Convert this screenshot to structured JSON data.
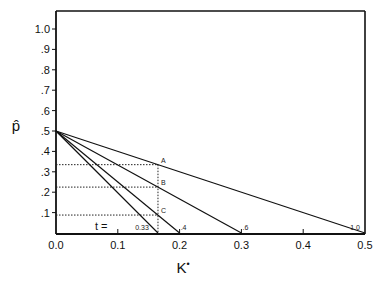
{
  "chart_data": {
    "type": "line",
    "title": "",
    "xlabel": "K*",
    "ylabel": "p̂",
    "xlim": [
      0.0,
      0.5
    ],
    "ylim": [
      0.0,
      1.08
    ],
    "x_ticks": [
      "0.0",
      "0.1",
      "0.2",
      "0.3",
      "0.4",
      "0.5"
    ],
    "y_ticks": [
      ".1",
      ".2",
      ".3",
      ".4",
      ".5",
      ".6",
      ".7",
      ".8",
      ".9",
      "1.0"
    ],
    "grid": false,
    "legend": null,
    "t_prefix": "t =",
    "series": [
      {
        "name": "0.33",
        "x": [
          0.0,
          0.165
        ],
        "y": [
          0.5,
          0.0
        ]
      },
      {
        "name": ".4",
        "x": [
          0.0,
          0.2
        ],
        "y": [
          0.5,
          0.0
        ]
      },
      {
        "name": ".6",
        "x": [
          0.0,
          0.3
        ],
        "y": [
          0.5,
          0.0
        ]
      },
      {
        "name": "1.0",
        "x": [
          0.0,
          0.5
        ],
        "y": [
          0.5,
          0.0
        ]
      }
    ],
    "annotations": [
      {
        "label": "A",
        "x": 0.165,
        "y": 0.335
      },
      {
        "label": "B",
        "x": 0.165,
        "y": 0.225
      },
      {
        "label": "C",
        "x": 0.165,
        "y": 0.088
      }
    ],
    "reference_lines": {
      "vertical_dotted_x": 0.165,
      "horizontal_dotted_y": [
        0.335,
        0.225,
        0.088
      ]
    }
  }
}
